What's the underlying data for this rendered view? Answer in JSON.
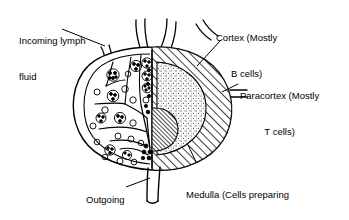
{
  "diagram": {
    "stroke_color": "#000000",
    "background_color": "#ffffff",
    "labels": {
      "incoming": {
        "name": "incoming-lymph-fluid",
        "line1": "Incoming lymph",
        "line2": "fluid"
      },
      "outgoing": {
        "name": "outgoing-lymph-fluid",
        "line1": "Outgoing",
        "line2": "lymph",
        "line3": "fluid"
      },
      "cortex": {
        "name": "cortex",
        "line1": "Cortex (Mostly",
        "line2": "B cells)"
      },
      "paracortex": {
        "name": "paracortex",
        "line1": "Paracortex (Mostly",
        "line2": "T cells)"
      },
      "medulla": {
        "name": "medulla",
        "line1": "Medulla (Cells preparing",
        "line2": "to exit lymph node)"
      }
    },
    "regions": [
      {
        "name": "cortex",
        "fill_pattern": "diagonal-hatch"
      },
      {
        "name": "paracortex",
        "fill_pattern": "stipple-dots"
      },
      {
        "name": "medulla",
        "fill_pattern": "dense-diagonal-hatch"
      },
      {
        "name": "follicles",
        "fill_pattern": "cell-clusters"
      }
    ],
    "vessels": [
      {
        "name": "afferent-vessel-left",
        "direction": "incoming"
      },
      {
        "name": "afferent-vessel-center",
        "direction": "incoming"
      },
      {
        "name": "afferent-vessel-right",
        "direction": "incoming"
      },
      {
        "name": "afferent-vessel-side",
        "direction": "incoming"
      },
      {
        "name": "efferent-vessel",
        "direction": "outgoing"
      }
    ]
  }
}
